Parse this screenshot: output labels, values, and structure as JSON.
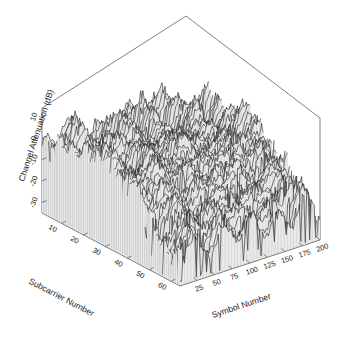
{
  "figure": {
    "background_color": "#ffffff",
    "line_color": "#1a1a1a",
    "axis_color": "#4a4a4a",
    "width": 342,
    "height": 346
  },
  "chart_data": {
    "type": "line",
    "render_style": "3d-surface-mesh",
    "title": "",
    "subtitle": "",
    "xlabel": "Subcarrier Number",
    "ylabel": "Symbol Number",
    "zlabel": "Channel Attenuation (dB)",
    "x_ticks": [
      "10",
      "20",
      "30",
      "40",
      "50",
      "60"
    ],
    "x_tick_values": [
      10,
      20,
      30,
      40,
      50,
      60
    ],
    "y_ticks": [
      "25",
      "50",
      "75",
      "100",
      "125",
      "150",
      "175",
      "200"
    ],
    "y_tick_values": [
      25,
      50,
      75,
      100,
      125,
      150,
      175,
      200
    ],
    "z_ticks": [
      "10",
      "0",
      "-10",
      "-20",
      "-30"
    ],
    "z_tick_values": [
      10,
      0,
      -10,
      -20,
      -30
    ],
    "xlim": [
      1,
      64
    ],
    "ylim": [
      1,
      200
    ],
    "zlim": [
      -35,
      14
    ],
    "grid": false,
    "legend": null,
    "annotations": [],
    "surface": {
      "nx": 64,
      "ny": 200,
      "mean_level": -4.0,
      "peak_level": 13.0,
      "null_level": -34.0,
      "ridge_position_fraction": 0.58
    }
  },
  "axes": {
    "z_axis_label": "Channel Attenuation (dB)",
    "x_axis_label": "Subcarrier Number",
    "y_axis_label": "Symbol Number"
  }
}
